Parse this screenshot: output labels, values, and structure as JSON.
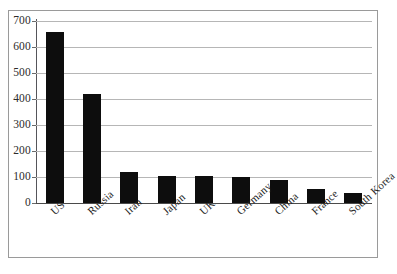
{
  "chart_data": {
    "type": "bar",
    "title": "",
    "subtitle": "",
    "xlabel": "",
    "ylabel": "",
    "categories": [
      "US",
      "Russia",
      "Iran",
      "Japan",
      "UK",
      "Germany",
      "China",
      "France",
      "South Korea"
    ],
    "values": [
      656,
      421,
      121,
      103,
      105,
      99,
      89,
      55,
      39
    ],
    "series": [
      {
        "name": "",
        "values": [
          656,
          421,
          121,
          103,
          105,
          99,
          89,
          55,
          39
        ]
      }
    ],
    "ylim": [
      0,
      700
    ],
    "yticks": [
      0,
      100,
      200,
      300,
      400,
      500,
      600,
      700
    ],
    "ytick_labels": [
      "0",
      "100",
      "200",
      "300",
      "400",
      "500",
      "600",
      "700"
    ],
    "grid": true,
    "grid_axis": "y",
    "legend": false,
    "legend_position": "none",
    "bar_color": "#0d0d0d",
    "gridline_color": "#b6b6b6",
    "axis_color": "#55555a",
    "background_color": "#ffffff",
    "frame_color": "#9a9a9a",
    "xlabel_rotation": -42
  }
}
